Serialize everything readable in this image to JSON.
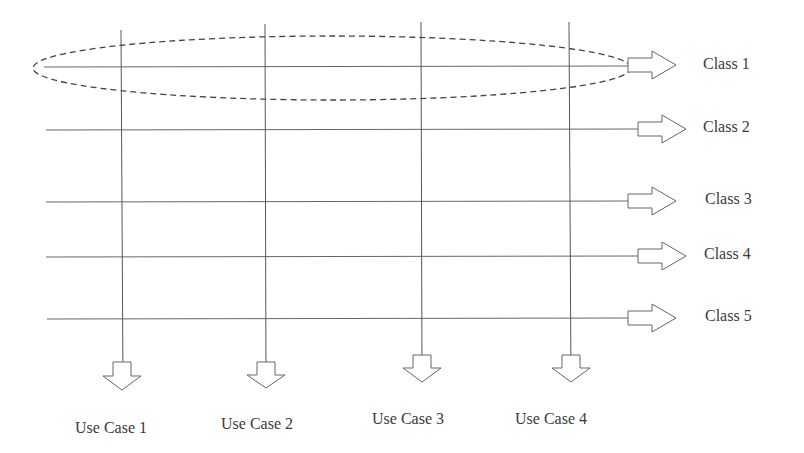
{
  "diagram": {
    "classes": [
      {
        "label": "Class 1",
        "y": 65,
        "highlighted": true
      },
      {
        "label": "Class 2",
        "y": 129
      },
      {
        "label": "Class 3",
        "y": 201
      },
      {
        "label": "Class 4",
        "y": 256
      },
      {
        "label": "Class 5",
        "y": 318
      }
    ],
    "use_cases": [
      {
        "label": "Use Case 1",
        "x": 122
      },
      {
        "label": "Use Case 2",
        "x": 266
      },
      {
        "label": "Use Case 3",
        "x": 422
      },
      {
        "label": "Use Case 4",
        "x": 570
      }
    ],
    "highlight": {
      "shape": "dashed-ellipse",
      "around": "Class 1"
    },
    "colors": {
      "line": "#555555",
      "arrow": "#666666",
      "text": "#3a3a3a",
      "background": "#ffffff"
    }
  }
}
